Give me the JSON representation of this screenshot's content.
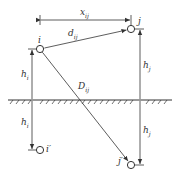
{
  "diagram": {
    "type": "image-method-geometry",
    "nodes": [
      {
        "id": "i",
        "label": "i",
        "x": 40,
        "y": 49
      },
      {
        "id": "j",
        "label": "j",
        "x": 131,
        "y": 29
      },
      {
        "id": "i_image",
        "label": "i′",
        "x": 40,
        "y": 150
      },
      {
        "id": "j_image",
        "label": "j′",
        "x": 131,
        "y": 165
      }
    ],
    "ground": {
      "y": 100,
      "x1": 8,
      "x2": 172
    },
    "labels": {
      "x_ij": {
        "base": "x",
        "sub": "ij"
      },
      "d_ij": {
        "base": "d",
        "sub": "ij"
      },
      "D_ij": {
        "base": "D",
        "sub": "ij"
      },
      "h_i_top": {
        "base": "h",
        "sub": "i"
      },
      "h_i_bottom": {
        "base": "h",
        "sub": "i"
      },
      "h_j_top": {
        "base": "h",
        "sub": "j"
      },
      "h_j_bottom": {
        "base": "h",
        "sub": "j"
      }
    },
    "colors": {
      "line": "#333333",
      "background": "#ffffff"
    }
  }
}
